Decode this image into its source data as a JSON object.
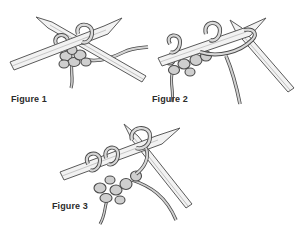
{
  "figures": [
    {
      "id": "figure-1",
      "caption": "Figure 1",
      "step": "Right needle inserted into stitch on left needle"
    },
    {
      "id": "figure-2",
      "caption": "Figure 2",
      "step": "Yarn wrapped around right needle"
    },
    {
      "id": "figure-3",
      "caption": "Figure 3",
      "step": "New loop drawn through onto right needle"
    }
  ],
  "colors": {
    "background": "#ffffff",
    "needle_fill": "#f2f2f2",
    "needle_stroke": "#5a5a5a",
    "yarn_fill": "#c9c9c9",
    "yarn_stroke": "#4a4a4a",
    "caption_text": "#2b2b2b"
  }
}
